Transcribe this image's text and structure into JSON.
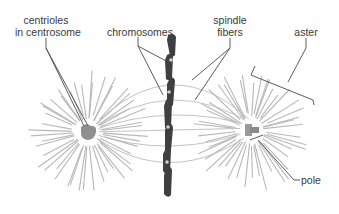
{
  "diagram": {
    "type": "mitotic spindle (metaphase)",
    "labels": {
      "centrioles_line1": "centrioles",
      "centrioles_line2": "in centrosome",
      "chromosomes": "chromosomes",
      "spindle_line1": "spindle",
      "spindle_line2": "fibers",
      "aster": "aster",
      "pole": "pole"
    },
    "colors": {
      "background": "#ffffff",
      "aster_rays": "#b8b8b8",
      "spindle_fibers": "#c4c4c4",
      "chromosomes": "#3f3f3f",
      "centrosome": "#8f8f8f",
      "leader_lines": "#4a4a4a",
      "label_text": "#3a3a3a"
    }
  }
}
